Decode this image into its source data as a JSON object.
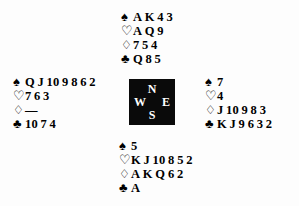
{
  "diagram": {
    "type": "bridge-deal-diagram",
    "background_color": "#fdfdfd",
    "text_color": "#000000"
  },
  "suits": {
    "spade": {
      "symbol": "♠",
      "name": "spade-symbol",
      "filled": true
    },
    "heart": {
      "symbol": "♡",
      "name": "heart-symbol",
      "filled": false
    },
    "diamond": {
      "symbol": "♢",
      "name": "diamond-symbol",
      "filled": false
    },
    "club": {
      "symbol": "♣",
      "name": "club-symbol",
      "filled": true
    }
  },
  "compass": {
    "background_color": "#0a0a0a",
    "text_color": "#ffffff",
    "north": "N",
    "west": "W",
    "east": "E",
    "south": "S"
  },
  "hands": {
    "north": {
      "position": "North",
      "spades": [
        "A",
        "K",
        "4",
        "3"
      ],
      "hearts": [
        "A",
        "Q",
        "9"
      ],
      "diamonds": [
        "7",
        "5",
        "4"
      ],
      "clubs": [
        "Q",
        "8",
        "5"
      ]
    },
    "west": {
      "position": "West",
      "spades": [
        "Q",
        "J",
        "10",
        "9",
        "8",
        "6",
        "2"
      ],
      "hearts": [
        "7",
        "6",
        "3"
      ],
      "diamonds": [
        "—"
      ],
      "clubs": [
        "10",
        "7",
        "4"
      ]
    },
    "east": {
      "position": "East",
      "spades": [
        "7"
      ],
      "hearts": [
        "4"
      ],
      "diamonds": [
        "J",
        "10",
        "9",
        "8",
        "3"
      ],
      "clubs": [
        "K",
        "J",
        "9",
        "6",
        "3",
        "2"
      ]
    },
    "south": {
      "position": "South",
      "spades": [
        "5"
      ],
      "hearts": [
        "K",
        "J",
        "10",
        "8",
        "5",
        "2"
      ],
      "diamonds": [
        "A",
        "K",
        "Q",
        "6",
        "2"
      ],
      "clubs": [
        "A"
      ]
    }
  }
}
